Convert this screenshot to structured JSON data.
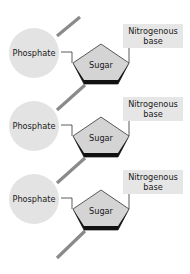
{
  "diagram": {
    "type": "nucleotide-chain",
    "units": [
      {
        "phosphate_label": "Phosphate",
        "sugar_label": "Sugar",
        "base_label_line1": "Nitrogenous",
        "base_label_line2": "base"
      },
      {
        "phosphate_label": "Phosphate",
        "sugar_label": "Sugar",
        "base_label_line1": "Nitrogenous",
        "base_label_line2": "base"
      },
      {
        "phosphate_label": "Phosphate",
        "sugar_label": "Sugar",
        "base_label_line1": "Nitrogenous",
        "base_label_line2": "base"
      }
    ],
    "colors": {
      "phosphate_fill": "#e3e3e3",
      "sugar_fill": "#d4d4d4",
      "sugar_edge": "#111111",
      "base_fill": "#e6e6e6",
      "backbone": "#8a8a8a",
      "connector": "#333333"
    }
  }
}
